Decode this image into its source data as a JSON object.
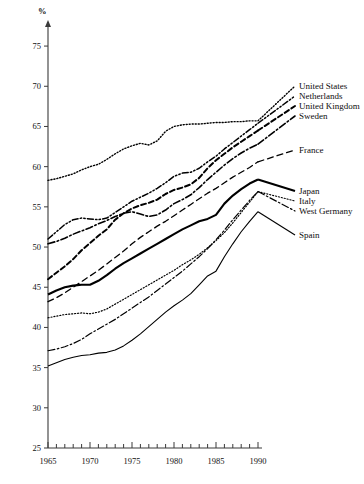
{
  "chart_data": {
    "type": "line",
    "title": "",
    "subtitle": "",
    "xlabel": "",
    "ylabel": "%",
    "ylabel_position": "top-left",
    "xlim": [
      1965,
      1990
    ],
    "ylim": [
      25,
      77
    ],
    "ytick_values": [
      25,
      30,
      35,
      40,
      45,
      50,
      55,
      60,
      65,
      70,
      75
    ],
    "ytick_labels": [
      "25",
      "30",
      "35",
      "40",
      "45",
      "50",
      "55",
      "60",
      "65",
      "70",
      "75"
    ],
    "xtick_values": [
      1965,
      1970,
      1975,
      1980,
      1985,
      1990
    ],
    "xtick_labels": [
      "1965",
      "1970",
      "1975",
      "1980",
      "1985",
      "1990"
    ],
    "x_minor_tick_interval": 1,
    "grid": false,
    "legend_position": "right-inline",
    "x": [
      1965,
      1966,
      1967,
      1968,
      1969,
      1970,
      1971,
      1972,
      1973,
      1974,
      1975,
      1976,
      1977,
      1978,
      1979,
      1980,
      1981,
      1982,
      1983,
      1984,
      1985,
      1986,
      1987,
      1988,
      1989,
      1990
    ],
    "series": [
      {
        "name": "United States",
        "label": "United States",
        "style": "dotted",
        "stroke_width": 1.4,
        "color": "#000000",
        "values": [
          58.3,
          58.5,
          58.8,
          59.1,
          59.6,
          60.0,
          60.3,
          60.9,
          61.6,
          62.2,
          62.6,
          62.9,
          62.7,
          63.2,
          64.4,
          65.0,
          65.2,
          65.3,
          65.3,
          65.4,
          65.5,
          65.5,
          65.6,
          65.6,
          65.7,
          65.7
        ]
      },
      {
        "name": "Netherlands",
        "label": "Netherlands",
        "style": "dash-dot-dot",
        "stroke_width": 1.5,
        "color": "#000000",
        "values": [
          51.0,
          51.9,
          52.8,
          53.4,
          53.6,
          53.5,
          53.4,
          53.6,
          54.3,
          55.0,
          55.7,
          56.2,
          56.7,
          57.3,
          58.0,
          58.8,
          59.2,
          59.3,
          59.8,
          60.6,
          61.3,
          62.2,
          63.0,
          63.8,
          64.6,
          65.4
        ]
      },
      {
        "name": "United Kingdom",
        "label": "United Kingdom",
        "style": "dashed",
        "stroke_width": 2.0,
        "color": "#000000",
        "values": [
          46.0,
          46.8,
          47.6,
          48.5,
          49.6,
          50.5,
          51.4,
          52.2,
          53.4,
          54.2,
          54.8,
          55.2,
          55.5,
          55.9,
          56.6,
          57.1,
          57.4,
          57.8,
          58.6,
          59.8,
          60.8,
          61.6,
          62.4,
          63.1,
          63.8,
          64.5
        ]
      },
      {
        "name": "Sweden",
        "label": "Sweden",
        "style": "dash-dot",
        "stroke_width": 1.6,
        "color": "#000000",
        "values": [
          50.4,
          50.7,
          51.1,
          51.6,
          52.0,
          52.4,
          52.9,
          53.3,
          53.8,
          54.2,
          54.4,
          54.1,
          53.8,
          54.0,
          54.6,
          55.4,
          55.9,
          56.5,
          57.4,
          58.4,
          59.3,
          60.2,
          61.0,
          61.7,
          62.3,
          62.8
        ]
      },
      {
        "name": "France",
        "label": "France",
        "style": "dashed-long",
        "stroke_width": 1.3,
        "color": "#000000",
        "values": [
          43.2,
          43.7,
          44.3,
          45.0,
          45.7,
          46.4,
          47.1,
          47.9,
          48.7,
          49.5,
          50.4,
          51.2,
          51.9,
          52.6,
          53.2,
          53.9,
          54.6,
          55.3,
          56.0,
          56.7,
          57.3,
          58.0,
          58.7,
          59.3,
          59.9,
          60.6
        ]
      },
      {
        "name": "Japan",
        "label": "Japan",
        "style": "solid-bold",
        "stroke_width": 2.1,
        "color": "#000000",
        "values": [
          44.1,
          44.6,
          45.0,
          45.2,
          45.3,
          45.3,
          45.8,
          46.5,
          47.3,
          48.0,
          48.6,
          49.2,
          49.8,
          50.4,
          51.0,
          51.6,
          52.2,
          52.7,
          53.2,
          53.5,
          54.0,
          55.4,
          56.4,
          57.2,
          57.9,
          58.4
        ]
      },
      {
        "name": "Italy",
        "label": "Italy",
        "style": "dotted",
        "stroke_width": 1.2,
        "color": "#000000",
        "values": [
          41.2,
          41.4,
          41.6,
          41.7,
          41.8,
          41.7,
          41.9,
          42.3,
          42.9,
          43.5,
          44.1,
          44.7,
          45.3,
          45.9,
          46.5,
          47.1,
          47.8,
          48.4,
          49.1,
          49.9,
          50.8,
          51.8,
          53.0,
          54.3,
          55.6,
          56.9
        ]
      },
      {
        "name": "West Germany",
        "label": "West Germany",
        "style": "dash-dot",
        "stroke_width": 1.2,
        "color": "#000000",
        "values": [
          37.1,
          37.3,
          37.6,
          38.0,
          38.5,
          39.2,
          39.8,
          40.4,
          41.0,
          41.7,
          42.4,
          43.1,
          43.8,
          44.6,
          45.4,
          46.2,
          47.0,
          47.9,
          48.8,
          49.8,
          50.9,
          52.1,
          53.4,
          54.6,
          55.8,
          56.9
        ]
      },
      {
        "name": "Spain",
        "label": "Spain",
        "style": "solid-thin",
        "stroke_width": 1.1,
        "color": "#000000",
        "values": [
          35.2,
          35.6,
          36.0,
          36.3,
          36.5,
          36.6,
          36.8,
          36.9,
          37.2,
          37.7,
          38.4,
          39.2,
          40.1,
          41.0,
          41.9,
          42.7,
          43.4,
          44.2,
          45.3,
          46.4,
          47.0,
          48.8,
          50.4,
          51.9,
          53.2,
          54.4
        ]
      }
    ],
    "legend_entries": [
      {
        "label": "United States",
        "x": 299,
        "y": 89
      },
      {
        "label": "Netherlands",
        "x": 299,
        "y": 99
      },
      {
        "label": "United Kingdom",
        "x": 299,
        "y": 109
      },
      {
        "label": "Sweden",
        "x": 299,
        "y": 119
      },
      {
        "label": "France",
        "x": 299,
        "y": 153
      },
      {
        "label": "Japan",
        "x": 299,
        "y": 194
      },
      {
        "label": "Italy",
        "x": 299,
        "y": 204
      },
      {
        "label": "West Germany",
        "x": 299,
        "y": 214
      },
      {
        "label": "Spain",
        "x": 299,
        "y": 238
      }
    ]
  }
}
